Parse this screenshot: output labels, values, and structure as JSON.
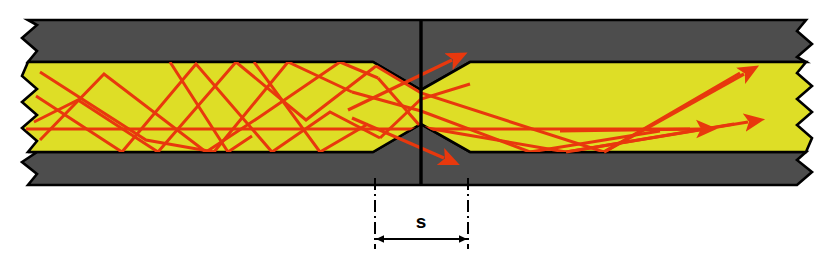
{
  "figure": {
    "kind": "optical-fiber-splice-ray-diagram",
    "title": "",
    "dimension_label": "s",
    "colors": {
      "cladding_gray": "#4d4d4d",
      "core_yellow": "#dede26",
      "ray_red": "#e8380d",
      "outline_black": "#000000",
      "background_white": "#ffffff"
    },
    "geometry": {
      "canvas_width": 840,
      "canvas_height": 264,
      "core_top_y": 62,
      "core_bottom_y": 152,
      "clad_top_y": 20,
      "clad_bottom_y": 185,
      "left_break_x": 28,
      "right_break_x": 806,
      "splice_plane_x": 421,
      "taper_left_x": 373,
      "taper_right_x": 470,
      "neck_half_height": 28
    }
  },
  "dimension": {
    "label": "s",
    "left_tick_x": 375,
    "right_tick_x": 468,
    "arrow_y": 239,
    "label_x": 421,
    "label_y": 221
  },
  "rays": {
    "note": "red ray traces inside the fiber core",
    "left_segment_paths": [
      "M 40,72 L 146,140 L 214,152 L 288,62 L 348,92",
      "M 34,122 L 78,100 L 158,152 L 236,62 L 306,120 L 374,66",
      "M 40,140 L 104,74 L 206,152 L 258,118 L 340,62 L 372,76",
      "M 36,96 L 122,152 L 196,64 L 272,152 L 330,112 L 374,136",
      "M 30,130 L 820,130"
    ],
    "taper_paths": [
      "M 348,92 L 421,110",
      "M 374,66 L 421,92",
      "M 372,76 L 421,128",
      "M 374,136 L 421,98"
    ],
    "escaping_rays": [
      {
        "path": "M 352,112 L 462,54",
        "arrow_at": [
          462,
          54
        ],
        "angle_deg": -28
      },
      {
        "path": "M 360,120 L 455,161",
        "arrow_at": [
          455,
          161
        ],
        "angle_deg": 24
      }
    ],
    "right_segment_paths": [
      "M 421,92 L 604,152 L 742,72",
      "M 421,128 L 560,152 L 735,124",
      "M 421,110 L 520,152 L 660,131"
    ],
    "right_arrows": [
      {
        "at": [
          748,
          70
        ],
        "angle_deg": -28
      },
      {
        "at": [
          752,
          120
        ],
        "angle_deg": -12
      },
      {
        "at": [
          706,
          128
        ],
        "angle_deg": -5
      }
    ]
  },
  "annotations": {
    "splice_plane_label": "",
    "left_break_label": "",
    "right_break_label": ""
  }
}
